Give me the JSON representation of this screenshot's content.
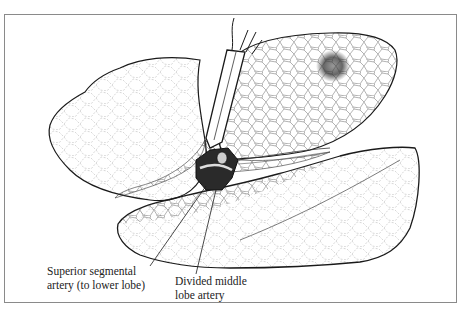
{
  "figure": {
    "colors": {
      "ink": "#1a1a1a",
      "frame": "#8a8a8a",
      "background": "#ffffff",
      "lesion": "#333333"
    },
    "labels": [
      {
        "id": "superior",
        "lines": [
          "Superior segmental",
          "artery (to lower lobe)"
        ]
      },
      {
        "id": "divided",
        "lines": [
          "Divided middle",
          "lobe artery"
        ]
      }
    ],
    "elements": [
      "upper-lobe",
      "upper-right-lobe-with-lesion",
      "lower-lobe",
      "surgical-clamp",
      "hilar-vessel-stump"
    ]
  }
}
